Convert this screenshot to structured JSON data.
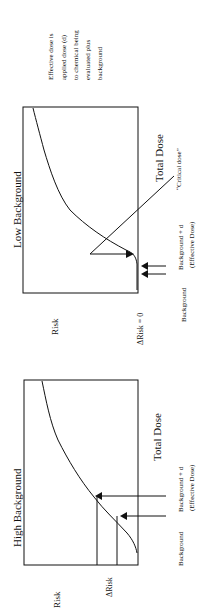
{
  "figure": {
    "orientation": "rotated-90-ccw",
    "panels": [
      {
        "id": "low",
        "title": "Low Background",
        "y_label": "Risk",
        "x_label": "Total Dose",
        "delta_label": "ΔRisk = 0",
        "critical_label": "“Critical dose”",
        "arrow_labels": {
          "background": "Background",
          "background_plus_d": "Background + d",
          "effective_dose": "(Effective Dose)"
        }
      },
      {
        "id": "high",
        "title": "High Background",
        "y_label": "Risk",
        "x_label": "Total Dose",
        "delta_label": "ΔRisk",
        "arrow_labels": {
          "background": "Background",
          "background_plus_d": "Background + d",
          "effective_dose": "(Effective Dose)"
        }
      }
    ],
    "note": [
      "Effective dose is",
      "applied dose (d)",
      "to chemical being",
      "evaluated  plus",
      "background"
    ]
  }
}
